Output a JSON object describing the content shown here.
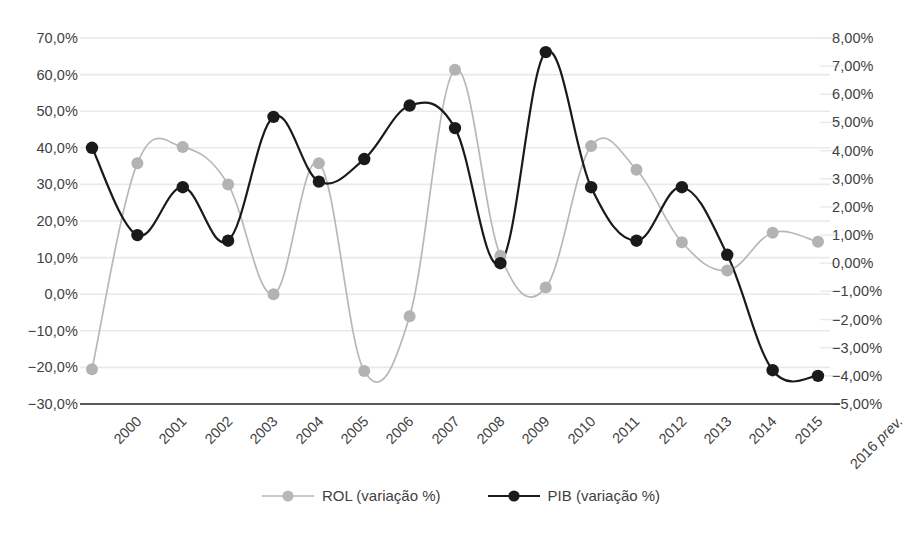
{
  "chart_data": {
    "type": "line",
    "title": "",
    "subtitle": "",
    "xlabel": "",
    "ylabel": "",
    "grid": true,
    "legend_position": "bottom",
    "categories": [
      "2000",
      "2001",
      "2002",
      "2003",
      "2004",
      "2005",
      "2006",
      "2007",
      "2008",
      "2009",
      "2010",
      "2011",
      "2012",
      "2013",
      "2014",
      "2015",
      "2016 prev."
    ],
    "x_tick_labels": [
      "2000",
      "2001",
      "2002",
      "2003",
      "2004",
      "2005",
      "2006",
      "2007",
      "2008",
      "2009",
      "2010",
      "2011",
      "2012",
      "2013",
      "2014",
      "2015",
      "2016"
    ],
    "x_tick_suffix": "prev.",
    "axes": {
      "left": {
        "name": "ROL (variação %)",
        "ylim": [
          -30,
          70
        ],
        "tick_step": 10,
        "tick_labels": [
          "70,0%",
          "60,0%",
          "50,0%",
          "40,0%",
          "30,0%",
          "20,0%",
          "10,0%",
          "0,0%",
          "−10,0%",
          "−20,0%",
          "−30,0%"
        ],
        "tick_values": [
          70,
          60,
          50,
          40,
          30,
          20,
          10,
          0,
          -10,
          -20,
          -30
        ]
      },
      "right": {
        "name": "PIB (variação %)",
        "ylim": [
          -5,
          8
        ],
        "tick_step": 1,
        "tick_labels": [
          "8,00%",
          "7,00%",
          "6,00%",
          "5,00%",
          "4,00%",
          "3,00%",
          "2,00%",
          "1,00%",
          "0,00%",
          "−1,00%",
          "−2,00%",
          "−3,00%",
          "−4,00%",
          "−5,00%"
        ],
        "tick_values": [
          8,
          7,
          6,
          5,
          4,
          3,
          2,
          1,
          0,
          -1,
          -2,
          -3,
          -4,
          -5
        ]
      }
    },
    "series": [
      {
        "name": "ROL (variação %)",
        "axis": "left",
        "color": "#b8b8b8",
        "marker_color": "#b3b3b3",
        "values": [
          -20.5,
          35.8,
          40.2,
          30.0,
          0.0,
          35.8,
          -21.0,
          -6.0,
          61.3,
          10.5,
          1.8,
          40.5,
          34.0,
          14.2,
          6.5,
          16.8,
          14.3
        ]
      },
      {
        "name": "PIB (variação %)",
        "axis": "right",
        "color": "#1a1a1a",
        "marker_color": "#1a1a1a",
        "values": [
          4.1,
          1.0,
          2.7,
          0.8,
          5.2,
          2.9,
          3.7,
          5.6,
          4.8,
          0.0,
          7.5,
          2.7,
          0.8,
          2.7,
          0.3,
          -3.8,
          -4.0
        ]
      }
    ],
    "legend": [
      {
        "label": "ROL (variação %)",
        "color": "#b8b8b8",
        "marker": "circle-marker"
      },
      {
        "label": "PIB (variação %)",
        "color": "#1a1a1a",
        "marker": "circle-marker"
      }
    ],
    "colors": {
      "grid": "#e9e9e9",
      "axis": "#5b5b5b",
      "text": "#3f3f3f",
      "rol": "#b8b8b8",
      "pib": "#1a1a1a"
    }
  }
}
